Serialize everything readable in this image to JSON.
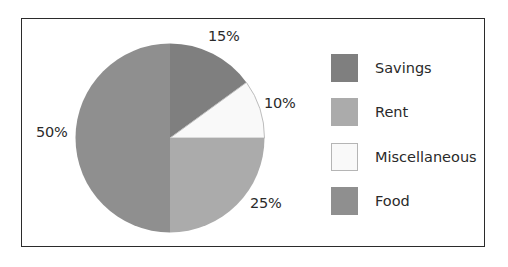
{
  "chart_data": {
    "type": "pie",
    "title": "",
    "categories": [
      "Savings",
      "Miscellaneous",
      "Rent",
      "Food"
    ],
    "values": [
      15,
      10,
      25,
      50
    ],
    "unit": "%",
    "start_angle_deg": 0,
    "direction": "clockwise",
    "slice_labels": [
      "15%",
      "10%",
      "25%",
      "50%"
    ],
    "colors": {
      "Savings": "#7f7f7f",
      "Miscellaneous": "#f9f9f9",
      "Rent": "#ababab",
      "Food": "#8f8f8f"
    },
    "legend_position": "right",
    "legend": [
      "Savings",
      "Rent",
      "Miscellaneous",
      "Food"
    ]
  },
  "labels": {
    "savings_pct": "15%",
    "misc_pct": "10%",
    "rent_pct": "25%",
    "food_pct": "50%"
  },
  "legend": {
    "items": [
      {
        "label": "Savings",
        "color": "#7f7f7f"
      },
      {
        "label": "Rent",
        "color": "#ababab"
      },
      {
        "label": "Miscellaneous",
        "color": "#f9f9f9"
      },
      {
        "label": "Food",
        "color": "#8f8f8f"
      }
    ]
  }
}
